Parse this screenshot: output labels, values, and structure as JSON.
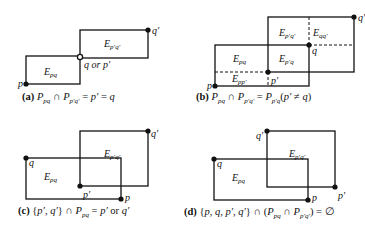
{
  "panels": [
    {
      "id": "a",
      "caption_tag": "(a)",
      "caption": "P_pq ∩ P_p'q' = p' = q",
      "regions": [
        "E_pq",
        "E_p'q'"
      ],
      "points": [
        "p",
        "q or p'",
        "q'"
      ]
    },
    {
      "id": "b",
      "caption_tag": "(b)",
      "caption": "P_pq ∩ P_p'q' = P_p'q(p' ≠ q)",
      "regions": [
        "E_pq",
        "E_p'q'",
        "E_qq'",
        "E_p'q",
        "E_pp'"
      ],
      "points": [
        "p",
        "p'",
        "q",
        "q'"
      ]
    },
    {
      "id": "c",
      "caption_tag": "(c)",
      "caption": "{p', q'} ∩ P_pq = p' or q'",
      "regions": [
        "E_pq",
        "E_p'q'"
      ],
      "points": [
        "q",
        "p'",
        "p",
        "q'"
      ]
    },
    {
      "id": "d",
      "caption_tag": "(d)",
      "caption": "{p, q, p', q'} ∩ (P_pq ∩ P_p'q') = ∅",
      "regions": [
        "E_pq",
        "E_p'q'"
      ],
      "points": [
        "q",
        "q'",
        "p",
        "p'"
      ]
    }
  ],
  "captions": {
    "a_tag": "(a)",
    "a_text": "P",
    "b_tag": "(b)",
    "c_tag": "(c)",
    "d_tag": "(d)"
  },
  "labels": {
    "p": "p",
    "q": "q",
    "pp": "p′",
    "qq": "q′",
    "q_or_p": "q or p′",
    "E": "E",
    "pq": "pq",
    "ppqq": "p′q′",
    "qqq": "qq′",
    "ppq": "p′q",
    "ppp": "pp′"
  }
}
